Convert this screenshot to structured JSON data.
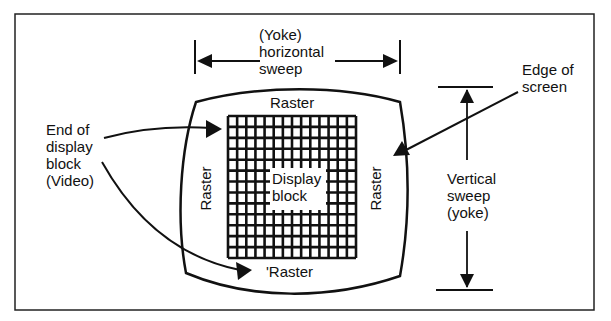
{
  "diagram": {
    "type": "crt-raster-display",
    "labels": {
      "horizontal_sweep": [
        "(Yoke)",
        "horizontal",
        "sweep"
      ],
      "edge_of_screen": [
        "Edge of",
        "screen"
      ],
      "end_of_display_block": [
        "End of",
        "display",
        "block",
        "(Video)"
      ],
      "raster_top": "Raster",
      "raster_left": "Raster",
      "raster_right": "Raster",
      "raster_bottom": "'Raster",
      "display_block": [
        "Display",
        "block"
      ],
      "vertical_sweep": [
        "Vertical",
        "sweep",
        "(yoke)"
      ]
    },
    "grid": {
      "columns": 14,
      "rows": 13
    },
    "colors": {
      "ink": "#111111",
      "background": "#ffffff"
    }
  }
}
